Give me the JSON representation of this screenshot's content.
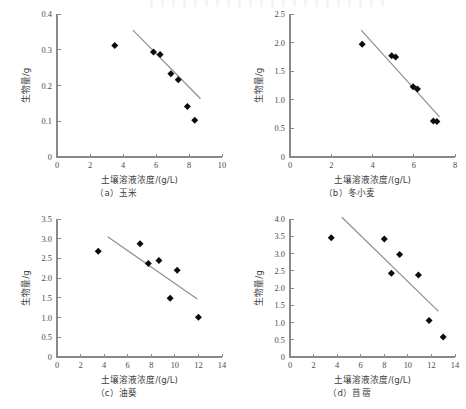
{
  "figure": {
    "shared_xlabel": "土壤溶液浓度/(g/L)",
    "shared_ylabel": "生物量/g"
  },
  "panels": [
    {
      "caption": "（a）玉米"
    },
    {
      "caption": "（b）冬小麦"
    },
    {
      "caption": "（c）油葵"
    },
    {
      "caption": "（d）苜蓿"
    }
  ],
  "chart_data": [
    {
      "type": "scatter",
      "panel_label": "(a)",
      "title": "（a）玉米",
      "xlabel": "土壤溶液浓度/(g/L)",
      "ylabel": "生物量/g",
      "xlim": [
        0,
        10
      ],
      "ylim": [
        0,
        0.4
      ],
      "xticks": [
        0,
        2,
        4,
        6,
        8,
        10
      ],
      "yticks": [
        0,
        0.1,
        0.2,
        0.3,
        0.4
      ],
      "xtick_labels": [
        "0",
        "2",
        "4",
        "6",
        "8",
        "10"
      ],
      "ytick_labels": [
        "0",
        "0.1",
        "0.2",
        "0.3",
        "0.4"
      ],
      "grid": false,
      "legend": null,
      "points": [
        {
          "x": 3.5,
          "y": 0.312
        },
        {
          "x": 5.85,
          "y": 0.294
        },
        {
          "x": 6.25,
          "y": 0.287
        },
        {
          "x": 6.9,
          "y": 0.233
        },
        {
          "x": 7.35,
          "y": 0.216
        },
        {
          "x": 7.9,
          "y": 0.141
        },
        {
          "x": 8.35,
          "y": 0.103
        }
      ],
      "trend_line": {
        "x1": 4.6,
        "y1": 0.355,
        "x2": 8.7,
        "y2": 0.163
      }
    },
    {
      "type": "scatter",
      "panel_label": "(b)",
      "title": "（b）冬小麦",
      "xlabel": "土壤溶液浓度/(g/L)",
      "ylabel": "生物量/g",
      "xlim": [
        0,
        8
      ],
      "ylim": [
        0,
        2.5
      ],
      "xticks": [
        0,
        2,
        4,
        6,
        8
      ],
      "yticks": [
        0,
        0.5,
        1.0,
        1.5,
        2.0,
        2.5
      ],
      "xtick_labels": [
        "0",
        "2",
        "4",
        "6",
        "8"
      ],
      "ytick_labels": [
        "0",
        "0.5",
        "1.0",
        "1.5",
        "2.0",
        "2.5"
      ],
      "grid": false,
      "legend": null,
      "points": [
        {
          "x": 3.5,
          "y": 1.97
        },
        {
          "x": 4.93,
          "y": 1.77
        },
        {
          "x": 5.12,
          "y": 1.75
        },
        {
          "x": 5.97,
          "y": 1.23
        },
        {
          "x": 6.18,
          "y": 1.19
        },
        {
          "x": 6.95,
          "y": 0.63
        },
        {
          "x": 7.12,
          "y": 0.62
        }
      ],
      "trend_line": {
        "x1": 3.45,
        "y1": 2.22,
        "x2": 7.25,
        "y2": 0.7
      }
    },
    {
      "type": "scatter",
      "panel_label": "(c)",
      "title": "（c）油葵",
      "xlabel": "土壤溶液浓度/(g/L)",
      "ylabel": "生物量/g",
      "xlim": [
        0,
        14
      ],
      "ylim": [
        0,
        3.5
      ],
      "xticks": [
        0,
        2,
        4,
        6,
        8,
        10,
        12,
        14
      ],
      "yticks": [
        0,
        0.5,
        1.0,
        1.5,
        2.0,
        2.5,
        3.0,
        3.5
      ],
      "xtick_labels": [
        "0",
        "2",
        "4",
        "6",
        "8",
        "10",
        "12",
        "14"
      ],
      "ytick_labels": [
        "0",
        "0.5",
        "1.0",
        "1.5",
        "2.0",
        "2.5",
        "3.0",
        "3.5"
      ],
      "grid": false,
      "legend": null,
      "points": [
        {
          "x": 3.5,
          "y": 2.68
        },
        {
          "x": 7.05,
          "y": 2.87
        },
        {
          "x": 7.75,
          "y": 2.37
        },
        {
          "x": 8.65,
          "y": 2.45
        },
        {
          "x": 9.6,
          "y": 1.49
        },
        {
          "x": 10.2,
          "y": 2.2
        },
        {
          "x": 12.0,
          "y": 1.01
        }
      ],
      "trend_line": {
        "x1": 4.3,
        "y1": 3.05,
        "x2": 11.9,
        "y2": 1.47
      }
    },
    {
      "type": "scatter",
      "panel_label": "(d)",
      "title": "（d）苜蓿",
      "xlabel": "土壤溶液浓度/(g/L)",
      "ylabel": "生物量/g",
      "xlim": [
        0,
        14
      ],
      "ylim": [
        0,
        4.0
      ],
      "xticks": [
        0,
        2,
        4,
        6,
        8,
        10,
        12,
        14
      ],
      "yticks": [
        0,
        0.5,
        1.0,
        1.5,
        2.0,
        2.5,
        3.0,
        3.5,
        4.0
      ],
      "xtick_labels": [
        "0",
        "2",
        "4",
        "6",
        "8",
        "10",
        "12",
        "14"
      ],
      "ytick_labels": [
        "0",
        "0.5",
        "1.0",
        "1.5",
        "2.0",
        "2.5",
        "3.0",
        "3.5",
        "4.0"
      ],
      "grid": false,
      "legend": null,
      "points": [
        {
          "x": 3.5,
          "y": 3.46
        },
        {
          "x": 8.0,
          "y": 3.42
        },
        {
          "x": 9.3,
          "y": 2.97
        },
        {
          "x": 8.6,
          "y": 2.43
        },
        {
          "x": 10.9,
          "y": 2.38
        },
        {
          "x": 11.8,
          "y": 1.06
        },
        {
          "x": 13.0,
          "y": 0.58
        }
      ],
      "trend_line": {
        "x1": 4.4,
        "y1": 4.05,
        "x2": 12.6,
        "y2": 1.32
      }
    }
  ]
}
